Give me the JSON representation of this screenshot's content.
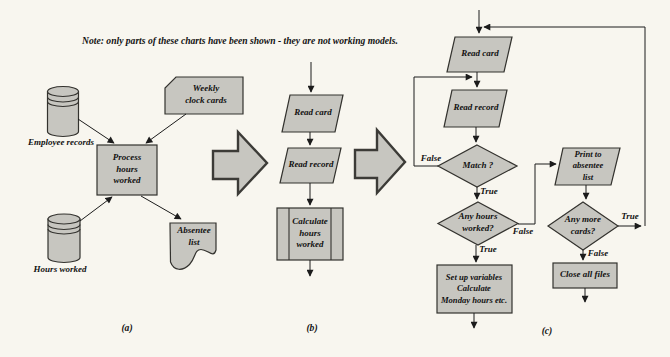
{
  "note": {
    "text": "Note: only parts of these charts have been shown - they are not working models."
  },
  "colors": {
    "background": "#f8f6ef",
    "shape_fill": "#c7c6c0",
    "shape_stroke": "#33322e",
    "line": "#1c1c1c",
    "text": "#121212"
  },
  "sections": {
    "a": {
      "caption": "(a)",
      "employee_records": "Employee records",
      "weekly_clock_cards": "Weekly\nclock cards",
      "process": "Process\nhours\nworked",
      "hours_worked": "Hours worked",
      "absentee_list": "Absentee\nlist"
    },
    "b": {
      "caption": "(b)",
      "read_card": "Read card",
      "read_record": "Read record",
      "calculate": "Calculate\nhours\nworked"
    },
    "c": {
      "caption": "(c)",
      "read_card": "Read card",
      "read_record": "Read record",
      "match": "Match ?",
      "match_false": "False",
      "match_true": "True",
      "any_hours": "Any hours\nworked?",
      "any_hours_false": "False",
      "any_hours_true": "True",
      "setup": "Set up variables\nCalculate\nMonday hours etc.",
      "print": "Print to\nabsentee\nlist",
      "any_more": "Any more\ncards?",
      "any_more_true": "True",
      "any_more_false": "False",
      "close": "Close all files"
    }
  }
}
